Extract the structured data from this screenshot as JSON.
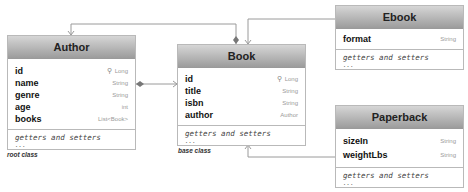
{
  "classes": {
    "author": {
      "name": "Author",
      "fields": [
        {
          "name": "id",
          "type": "Long",
          "key": true
        },
        {
          "name": "name",
          "type": "String"
        },
        {
          "name": "genre",
          "type": "String"
        },
        {
          "name": "age",
          "type": "int"
        },
        {
          "name": "books",
          "type": "List<Book>"
        }
      ],
      "methods": "getters and setters",
      "more": "...",
      "caption": "root class"
    },
    "book": {
      "name": "Book",
      "fields": [
        {
          "name": "id",
          "type": "Long",
          "key": true
        },
        {
          "name": "title",
          "type": "String"
        },
        {
          "name": "isbn",
          "type": "String"
        },
        {
          "name": "author",
          "type": "Author"
        }
      ],
      "methods": "getters and setters",
      "more": "...",
      "caption": "base class"
    },
    "ebook": {
      "name": "Ebook",
      "fields": [
        {
          "name": "format",
          "type": "String"
        }
      ],
      "methods": "getters and setters",
      "more": "..."
    },
    "paperback": {
      "name": "Paperback",
      "fields": [
        {
          "name": "sizeIn",
          "type": "String"
        },
        {
          "name": "weightLbs",
          "type": "String"
        }
      ],
      "methods": "getters and setters",
      "more": "..."
    }
  },
  "icons": {
    "key": "⚲"
  },
  "colors": {
    "line": "#8a8a8a",
    "header_top": "#d6d6d6",
    "header_bottom": "#9c9c9c"
  }
}
